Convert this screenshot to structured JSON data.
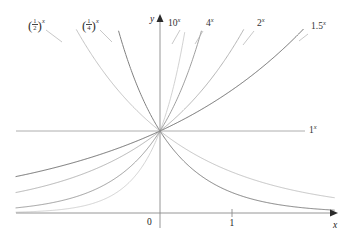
{
  "figure": {
    "type": "exponential-functions-graph",
    "background_color": "#ffffff"
  },
  "axes": {
    "x_axis_label": "x",
    "y_axis_label": "y",
    "origin_label": "0",
    "x_ticks": [
      {
        "value": 1,
        "label": "1"
      }
    ],
    "y_ticks": [],
    "x_range": [
      -2.0,
      2.42
    ],
    "y_range": [
      -0.02,
      2.25
    ],
    "grid": false,
    "axis_color": "#8a8a8a",
    "arrow_x": true,
    "arrow_y": true
  },
  "horizontal_line": {
    "label": "1",
    "label_exponent": "x",
    "y_value": 1,
    "color": "#9a9a9a"
  },
  "chart_data": {
    "type": "line",
    "title": "",
    "xlabel": "x",
    "ylabel": "y",
    "xlim": [
      -2.0,
      2.42
    ],
    "ylim": [
      -0.02,
      2.25
    ],
    "grid": false,
    "legend": "inline-curve-labels",
    "series": [
      {
        "name": "(1/2)^x",
        "label_base_numerator": "1",
        "label_base_denominator": "2",
        "label_exponent": "x",
        "base": 0.5,
        "color": "#b9b9b9",
        "label_x": 28,
        "label_y": 18
      },
      {
        "name": "(1/4)^x",
        "label_base_numerator": "1",
        "label_base_denominator": "4",
        "label_exponent": "x",
        "base": 0.25,
        "color": "#808080",
        "label_x": 82,
        "label_y": 18
      },
      {
        "name": "10^x",
        "label_base": "10",
        "label_exponent": "x",
        "base": 10,
        "color": "#cacaca",
        "label_x": 168,
        "label_y": 17
      },
      {
        "name": "4^x",
        "label_base": "4",
        "label_exponent": "x",
        "base": 4,
        "color": "#8e8e8e",
        "label_x": 206,
        "label_y": 17
      },
      {
        "name": "2^x",
        "label_base": "2",
        "label_exponent": "x",
        "base": 2,
        "color": "#a8a8a8",
        "label_x": 257,
        "label_y": 17
      },
      {
        "name": "1.5^x",
        "label_base": "1.5",
        "label_exponent": "x",
        "base": 1.5,
        "color": "#6f6f6f",
        "label_x": 311,
        "label_y": 20
      },
      {
        "name": "1^x",
        "label_base": "1",
        "label_exponent": "x",
        "base": 1,
        "color": "#9a9a9a",
        "label_x": 309,
        "label_y": 124
      }
    ]
  }
}
